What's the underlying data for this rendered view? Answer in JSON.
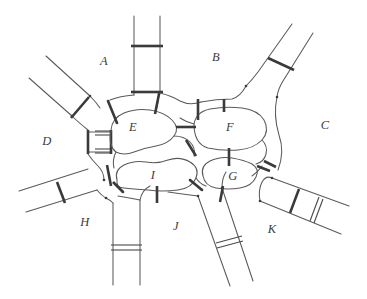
{
  "figure": {
    "kind": "hand-drawn topological region diagram",
    "width": 367,
    "height": 299,
    "background_color": "#ffffff",
    "line_color": "#5a5a5a",
    "bar_color": "#3a3a3a",
    "label_color": "#3c3c3c"
  },
  "regions": [
    {
      "id": "A",
      "label": "A",
      "x": 104,
      "y": 65,
      "type": "outer"
    },
    {
      "id": "B",
      "label": "B",
      "x": 216,
      "y": 61,
      "type": "outer"
    },
    {
      "id": "C",
      "label": "C",
      "x": 325,
      "y": 129,
      "type": "outer"
    },
    {
      "id": "D",
      "label": "D",
      "x": 47,
      "y": 145,
      "type": "outer"
    },
    {
      "id": "E",
      "label": "E",
      "x": 133,
      "y": 127,
      "type": "inner"
    },
    {
      "id": "F",
      "label": "F",
      "x": 230,
      "y": 127,
      "type": "inner"
    },
    {
      "id": "G",
      "label": "G",
      "x": 233,
      "y": 176,
      "type": "inner"
    },
    {
      "id": "H",
      "label": "H",
      "x": 85,
      "y": 226,
      "type": "outer"
    },
    {
      "id": "I",
      "label": "I",
      "x": 153,
      "y": 175,
      "type": "inner"
    },
    {
      "id": "J",
      "label": "J",
      "x": 176,
      "y": 230,
      "type": "outer"
    },
    {
      "id": "K",
      "label": "K",
      "x": 272,
      "y": 233,
      "type": "outer"
    }
  ],
  "channels": [
    {
      "name": "channel-A-B-north",
      "orientation": "vertical",
      "gate_count": 2
    },
    {
      "name": "channel-B-C-northeast",
      "orientation": "diagonal",
      "gate_count": 1
    },
    {
      "name": "channel-A-D-northwest",
      "orientation": "diagonal",
      "gate_count": 1
    },
    {
      "name": "channel-D-E-west",
      "orientation": "horizontal",
      "gate_count": 2
    },
    {
      "name": "channel-D-H-southwest",
      "orientation": "diagonal",
      "gate_count": 1
    },
    {
      "name": "channel-H-J-south",
      "orientation": "vertical",
      "gate_count": 2
    },
    {
      "name": "channel-J-K-southeast",
      "orientation": "diagonal",
      "gate_count": 1
    },
    {
      "name": "channel-K-C-east",
      "orientation": "diagonal",
      "gate_count": 2
    },
    {
      "name": "channel-A-E-gate",
      "orientation": "short",
      "gate_count": 1
    },
    {
      "name": "channel-A-E-gate-2",
      "orientation": "short",
      "gate_count": 1
    },
    {
      "name": "channel-A-F-gate",
      "orientation": "short",
      "gate_count": 1
    },
    {
      "name": "channel-B-F-gate",
      "orientation": "short",
      "gate_count": 1
    },
    {
      "name": "channel-B-F-gate-2",
      "orientation": "short",
      "gate_count": 1
    },
    {
      "name": "channel-E-F-gate",
      "orientation": "short",
      "gate_count": 1
    },
    {
      "name": "channel-E-I-gate",
      "orientation": "short",
      "gate_count": 1
    },
    {
      "name": "channel-F-G-gate",
      "orientation": "short",
      "gate_count": 1
    },
    {
      "name": "channel-G-C-gate",
      "orientation": "short",
      "gate_count": 1
    },
    {
      "name": "channel-I-J-gate",
      "orientation": "short",
      "gate_count": 1
    },
    {
      "name": "channel-I-G-gate",
      "orientation": "short",
      "gate_count": 1
    },
    {
      "name": "channel-G-J-gate",
      "orientation": "short",
      "gate_count": 1
    },
    {
      "name": "channel-E-H-gate",
      "orientation": "short",
      "gate_count": 1
    },
    {
      "name": "channel-H-I-gate",
      "orientation": "short",
      "gate_count": 1
    },
    {
      "name": "channel-K-G-gate",
      "orientation": "short",
      "gate_count": 1
    }
  ]
}
